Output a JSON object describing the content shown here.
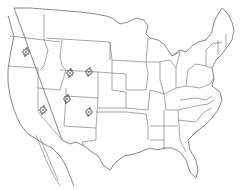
{
  "map": {
    "title": "",
    "region": "Contiguous United States with state borders",
    "background_color": "#ffffff",
    "line_color": "#6b6b6b",
    "marker_color": "#222222",
    "marker_icon": "flower-cluster-icon",
    "markers": [
      {
        "id": "oregon",
        "x": 26,
        "y": 52
      },
      {
        "id": "idaho-wyoming",
        "x": 70,
        "y": 73
      },
      {
        "id": "wyoming",
        "x": 89,
        "y": 72
      },
      {
        "id": "nevada",
        "x": 43,
        "y": 110
      },
      {
        "id": "utah",
        "x": 67,
        "y": 99
      },
      {
        "id": "colorado",
        "x": 89,
        "y": 112
      }
    ]
  }
}
